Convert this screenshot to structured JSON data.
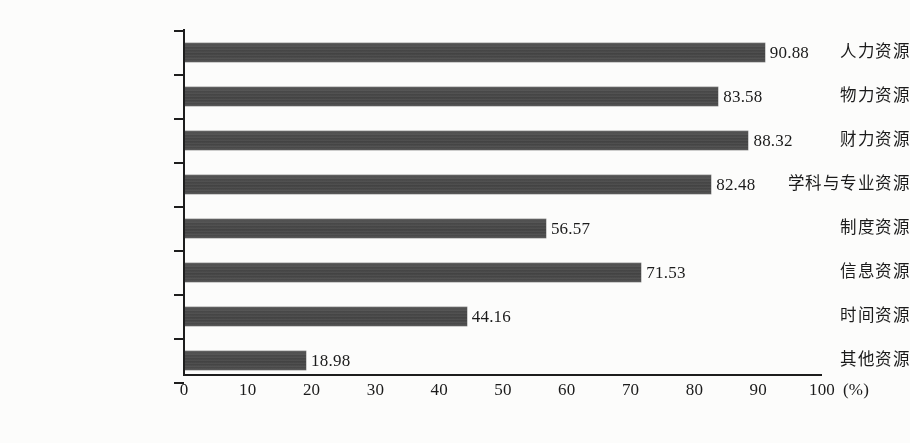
{
  "chart_data": {
    "type": "bar",
    "orientation": "horizontal",
    "title": "",
    "subtitle": "",
    "xlabel": "(%)",
    "ylabel": "",
    "xlim": [
      0,
      100
    ],
    "grid": false,
    "legend": null,
    "bar_color": "#4a4a4a",
    "axis_color": "#1d1d1d",
    "background_color": "#fdfdfc",
    "value_label_format": "two-decimal",
    "categories": [
      "人力资源",
      "物力资源",
      "财力资源",
      "学科与专业资源",
      "制度资源",
      "信息资源",
      "时间资源",
      "其他资源"
    ],
    "values": [
      90.88,
      83.58,
      88.32,
      82.48,
      56.57,
      71.53,
      44.16,
      18.98
    ],
    "value_labels": [
      "90.88",
      "83.58",
      "88.32",
      "82.48",
      "56.57",
      "71.53",
      "44.16",
      "18.98"
    ],
    "x_ticks": [
      0,
      10,
      20,
      30,
      40,
      50,
      60,
      70,
      80,
      90,
      100
    ],
    "x_tick_labels": [
      "0",
      "10",
      "20",
      "30",
      "40",
      "50",
      "60",
      "70",
      "80",
      "90",
      "100"
    ],
    "unit_label": "(%)"
  },
  "geometry": {
    "axis_origin_x": 184,
    "axis_right_x": 822,
    "axis_top_y": 29,
    "axis_bottom_y": 375,
    "px_per_unit": 6.38,
    "row_pitch": 44,
    "first_row_top": 30,
    "bar_height": 19,
    "bar_offset_in_row": 13
  }
}
